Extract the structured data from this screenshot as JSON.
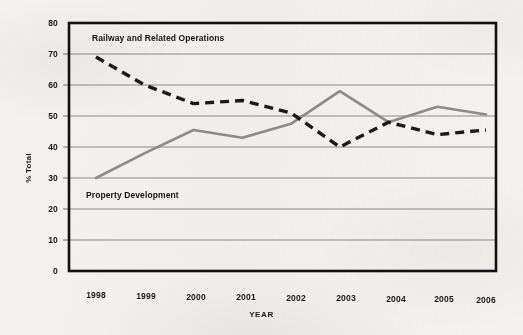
{
  "axes": {
    "y_title": "% Total",
    "x_title": "YEAR",
    "y_ticks": [
      "80",
      "70",
      "60",
      "50",
      "40",
      "30",
      "20",
      "10",
      "0"
    ],
    "x_ticks": [
      "1998",
      "1999",
      "2000",
      "2001",
      "2002",
      "2003",
      "2004",
      "2005",
      "2006"
    ]
  },
  "annotations": {
    "railway": "Railway and Related Operations",
    "property": "Property Development"
  },
  "colors": {
    "railway_line": "#1a1a1a",
    "property_line": "#8c8c8c",
    "gridline": "#8a8a8a",
    "frame": "#111111",
    "background": "#f3f2ef"
  },
  "chart_data": {
    "type": "line",
    "title": "",
    "xlabel": "YEAR",
    "ylabel": "% Total",
    "x": [
      "1998",
      "1999",
      "2000",
      "2001",
      "2002",
      "2003",
      "2004",
      "2005",
      "2006"
    ],
    "ylim": [
      0,
      80
    ],
    "ytick_step": 10,
    "xlim_labels": [
      "1998",
      "2006"
    ],
    "grid": "horizontal",
    "legend": "inline-annotations",
    "series": [
      {
        "name": "Railway and Related Operations",
        "style": "dashed",
        "color": "#1a1a1a",
        "values": [
          69,
          60,
          54,
          55,
          51,
          40,
          48,
          44,
          45.5
        ]
      },
      {
        "name": "Property Development",
        "style": "solid",
        "color": "#8c8c8c",
        "values": [
          30,
          38,
          45.5,
          43,
          47.5,
          58,
          48,
          53,
          50.5
        ]
      }
    ]
  }
}
